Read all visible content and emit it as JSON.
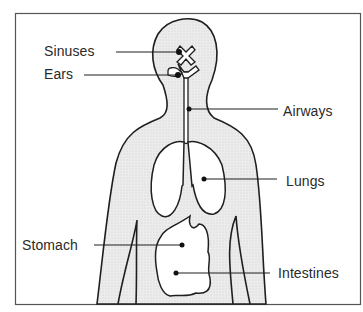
{
  "diagram": {
    "type": "anatomical-labeled-figure",
    "labels": {
      "sinuses": "Sinuses",
      "ears": "Ears",
      "airways": "Airways",
      "lungs": "Lungs",
      "stomach": "Stomach",
      "intestines": "Intestines"
    },
    "colors": {
      "outline": "#1f1f1f",
      "body_fill": "#e6e6e6",
      "organ_fill": "#ffffff",
      "frame": "#555555",
      "text": "#2a2a2a"
    }
  }
}
